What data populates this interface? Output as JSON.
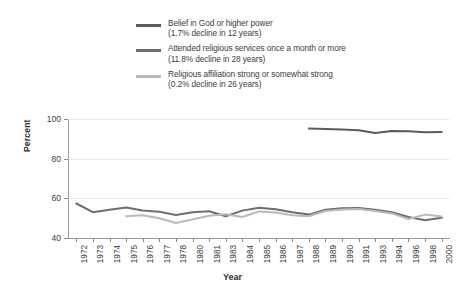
{
  "chart_data": {
    "type": "line",
    "title": "",
    "xlabel": "Year",
    "ylabel": "Percent",
    "ylim": [
      40,
      100
    ],
    "yticks": [
      40,
      60,
      80,
      100
    ],
    "grid": true,
    "legend_position": "top",
    "categories": [
      "1972",
      "1973",
      "1974",
      "1975",
      "1976",
      "1977",
      "1978",
      "1980",
      "1981",
      "1983",
      "1984",
      "1985",
      "1986",
      "1987",
      "1988",
      "1989",
      "1990",
      "1991",
      "1993",
      "1994",
      "1996",
      "1998",
      "2000"
    ],
    "series": [
      {
        "name": "Belief in God or higher power",
        "note": "(1.7% decline in 12 years)",
        "color": "#5b5b5b",
        "values": [
          null,
          null,
          null,
          null,
          null,
          null,
          null,
          null,
          null,
          null,
          null,
          null,
          null,
          null,
          95.2,
          95.0,
          94.7,
          94.3,
          92.9,
          94.0,
          93.8,
          93.3,
          93.5
        ]
      },
      {
        "name": "Attended religious services once a month or more",
        "note": "(11.8% decline in 28 years)",
        "color": "#6e6e6e",
        "values": [
          57.4,
          53.0,
          54.2,
          55.4,
          53.9,
          53.2,
          51.6,
          53.0,
          53.5,
          51.0,
          53.8,
          55.3,
          54.5,
          53.0,
          51.8,
          54.3,
          55.0,
          55.1,
          54.2,
          53.0,
          50.6,
          49.0,
          50.2
        ]
      },
      {
        "name": "Religious affiliation strong or somewhat strong",
        "note": "(0.2% decline in 26 years)",
        "color": "#b9b9b9",
        "values": [
          null,
          null,
          null,
          51.0,
          51.5,
          50.0,
          47.6,
          49.4,
          51.2,
          52.0,
          50.6,
          53.4,
          52.8,
          51.5,
          51.0,
          53.6,
          54.4,
          54.6,
          53.6,
          52.4,
          49.6,
          51.8,
          50.8
        ]
      }
    ]
  },
  "legend": {
    "items": [
      {
        "label": "Belief in God or higher power",
        "sub": "(1.7% decline in 12 years)",
        "color": "#5b5b5b"
      },
      {
        "label": "Attended religious services once a month or more",
        "sub": "(11.8% decline in 28 years)",
        "color": "#6e6e6e"
      },
      {
        "label": "Religious affiliation strong or somewhat strong",
        "sub": "(0.2% decline in 26 years)",
        "color": "#b9b9b9"
      }
    ]
  },
  "axes": {
    "y_title": "Percent",
    "x_title": "Year"
  }
}
